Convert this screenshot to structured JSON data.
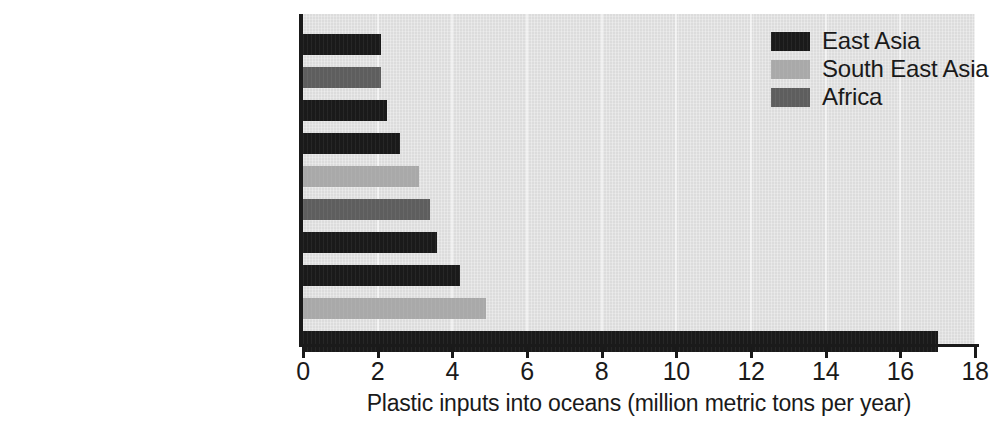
{
  "chart_data": {
    "type": "bar",
    "orientation": "horizontal",
    "title": "",
    "xlabel": "Plastic inputs into oceans (million metric tons per year)",
    "ylabel": "",
    "xlim": [
      0,
      18
    ],
    "xticks": [
      0,
      2,
      4,
      6,
      8,
      10,
      12,
      14,
      16,
      18
    ],
    "xtick_labels": [
      "0",
      "2",
      "4",
      "6",
      "8",
      "10",
      "12",
      "14",
      "16",
      "18"
    ],
    "grid": false,
    "legend_position": "top-right",
    "categories": [
      "Mekong",
      "Niger",
      "Amur",
      "Pearl River",
      "Meghna, Bramaputra, Ganges",
      "Nile",
      "Hai He",
      "Yellow River",
      "Indus",
      "Yangtze River"
    ],
    "values": [
      2.1,
      2.1,
      2.25,
      2.6,
      3.1,
      3.4,
      3.6,
      4.2,
      4.9,
      17.0
    ],
    "groups": [
      "East Asia",
      "Africa",
      "East Asia",
      "East Asia",
      "South East Asia",
      "Africa",
      "East Asia",
      "East Asia",
      "South East Asia",
      "East Asia"
    ],
    "series": [
      {
        "name": "East Asia",
        "color": "#1a1a1a",
        "points": [
          {
            "category": "Mekong",
            "value": 2.1
          },
          {
            "category": "Amur",
            "value": 2.25
          },
          {
            "category": "Pearl River",
            "value": 2.6
          },
          {
            "category": "Hai He",
            "value": 3.6
          },
          {
            "category": "Yellow River",
            "value": 4.2
          },
          {
            "category": "Yangtze River",
            "value": 17.0
          }
        ]
      },
      {
        "name": "South East Asia",
        "color": "#a9a9a9",
        "points": [
          {
            "category": "Meghna, Bramaputra, Ganges",
            "value": 3.1
          },
          {
            "category": "Indus",
            "value": 4.9
          }
        ]
      },
      {
        "name": "Africa",
        "color": "#5e5e5e",
        "points": [
          {
            "category": "Niger",
            "value": 2.1
          },
          {
            "category": "Nile",
            "value": 3.4
          }
        ]
      }
    ]
  },
  "legend": {
    "items": [
      {
        "label": "East Asia",
        "color": "#1a1a1a",
        "key": "east-asia"
      },
      {
        "label": "South East Asia",
        "color": "#a9a9a9",
        "key": "south-east-asia"
      },
      {
        "label": "Africa",
        "color": "#5e5e5e",
        "key": "africa"
      }
    ]
  },
  "axis": {
    "x_title": "Plastic inputs into oceans (million metric tons per year)",
    "tick_labels": [
      "0",
      "2",
      "4",
      "6",
      "8",
      "10",
      "12",
      "14",
      "16",
      "18"
    ]
  },
  "colors": {
    "east_asia": "#1a1a1a",
    "south_east_asia": "#a9a9a9",
    "africa": "#5e5e5e",
    "plot_background": "#dcdcdc",
    "axis": "#1a1a1a",
    "page_background": "#ffffff"
  }
}
